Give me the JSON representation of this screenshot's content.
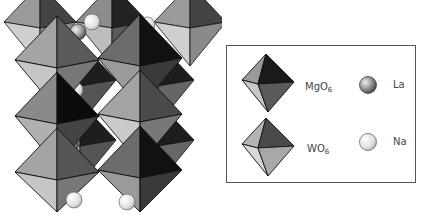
{
  "figure": {
    "structure_view": "polyhedral perspective model"
  },
  "legend": {
    "items": [
      {
        "key": "mgo6",
        "label_base": "MgO",
        "label_sub": "6",
        "symbol": "octahedron-dark",
        "colors": {
          "top_right": "#1a1a1a",
          "left": "#9a9a9a",
          "bottom": "#5a5a5a",
          "lower_left": "#c8c8c8"
        }
      },
      {
        "key": "wo6",
        "label_base": "WO",
        "label_sub": "6",
        "symbol": "octahedron-light",
        "colors": {
          "top_right": "#4a4a4a",
          "left": "#b4b4b4",
          "bottom": "#a8a8a8",
          "lower_left": "#d8d8d8"
        }
      },
      {
        "key": "la",
        "label": "La",
        "symbol": "sphere-dark",
        "colors": {
          "center": "#dddddd",
          "edge": "#444444"
        }
      },
      {
        "key": "na",
        "label": "Na",
        "symbol": "sphere-light",
        "colors": {
          "center": "#ffffff",
          "edge": "#aaaaaa"
        }
      }
    ]
  },
  "colors": {
    "outline": "#111111",
    "background": "#ffffff",
    "box_border": "#555555"
  }
}
